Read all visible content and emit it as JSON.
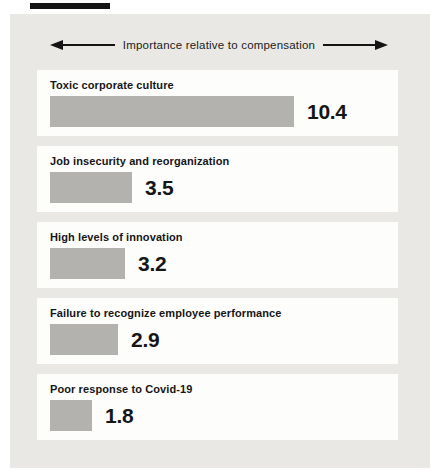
{
  "page": {
    "type": "static-bar-chart-figure"
  },
  "colors": {
    "page_background": "#ffffff",
    "panel_background": "#e9e8e4",
    "card_background": "#fdfdfc",
    "bar_fill": "#b3b2af",
    "text": "#161616",
    "arrow": "#141414",
    "top_rule": "#141414"
  },
  "header": {
    "axis_label": "Importance relative to compensation"
  },
  "chart_data": {
    "type": "bar",
    "orientation": "horizontal",
    "title": "Importance relative to compensation",
    "xlabel": "Importance relative to compensation",
    "categories": [
      "Toxic corporate culture",
      "Job insecurity and reorganization",
      "High levels of innovation",
      "Failure to recognize employee performance",
      "Poor response to Covid-19"
    ],
    "values": [
      10.4,
      3.5,
      3.2,
      2.9,
      1.8
    ],
    "value_labels": [
      "10.4",
      "3.5",
      "3.2",
      "2.9",
      "1.8"
    ],
    "xlim": [
      0,
      10.4
    ],
    "grid": false,
    "legend": false,
    "value_labels_position": "right-of-bar"
  },
  "bars": [
    {
      "label": "Toxic corporate culture",
      "value": "10.4"
    },
    {
      "label": "Job insecurity and reorganization",
      "value": "3.5"
    },
    {
      "label": "High levels of innovation",
      "value": "3.2"
    },
    {
      "label": "Failure to recognize employee performance",
      "value": "2.9"
    },
    {
      "label": "Poor response to Covid-19",
      "value": "1.8"
    }
  ]
}
